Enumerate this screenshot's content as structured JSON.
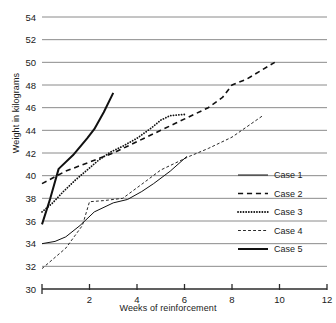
{
  "chart_data": {
    "type": "line",
    "title": "",
    "xlabel": "Weeks of reinforcement",
    "ylabel": "Weight in kilograms",
    "xlim": [
      0,
      12
    ],
    "ylim": [
      30,
      54
    ],
    "xticks": [
      0,
      2,
      4,
      6,
      8,
      10,
      12
    ],
    "xtick_labels": [
      "",
      "2",
      "4",
      "6",
      "8",
      "10",
      "12"
    ],
    "yticks": [
      30,
      32,
      34,
      36,
      38,
      40,
      42,
      44,
      46,
      48,
      50,
      52,
      54
    ],
    "ytick_labels": [
      "30",
      "32",
      "34",
      "36",
      "38",
      "40",
      "42",
      "44",
      "46",
      "48",
      "50",
      "52",
      "54"
    ],
    "grid": "horizontal",
    "legend_position": "middle-right",
    "series": [
      {
        "name": "Case 1",
        "style": "solid",
        "width": 1.0,
        "points": [
          [
            0,
            34.0
          ],
          [
            0.55,
            34.2
          ],
          [
            1.0,
            34.6
          ],
          [
            1.6,
            35.6
          ],
          [
            2.2,
            36.8
          ],
          [
            3.0,
            37.6
          ],
          [
            3.6,
            37.9
          ],
          [
            4.2,
            38.6
          ],
          [
            4.7,
            39.3
          ],
          [
            5.4,
            40.4
          ],
          [
            6.1,
            41.7
          ]
        ]
      },
      {
        "name": "Case 2",
        "style": "dashed",
        "width": 1.6,
        "points": [
          [
            0,
            39.3
          ],
          [
            1.0,
            40.4
          ],
          [
            2.0,
            41.2
          ],
          [
            3.0,
            42.0
          ],
          [
            4.0,
            43.0
          ],
          [
            5.0,
            44.0
          ],
          [
            5.6,
            44.6
          ],
          [
            6.2,
            45.2
          ],
          [
            7.0,
            46.0
          ],
          [
            7.6,
            46.9
          ],
          [
            8.0,
            48.0
          ],
          [
            8.6,
            48.5
          ],
          [
            9.8,
            50.0
          ]
        ]
      },
      {
        "name": "Case 3",
        "style": "dotted",
        "width": 1.8,
        "points": [
          [
            0,
            36.8
          ],
          [
            0.45,
            37.6
          ],
          [
            0.9,
            38.6
          ],
          [
            1.4,
            39.6
          ],
          [
            1.9,
            40.5
          ],
          [
            2.4,
            41.4
          ],
          [
            2.9,
            42.1
          ],
          [
            3.4,
            42.6
          ],
          [
            4.0,
            43.3
          ],
          [
            4.6,
            44.2
          ],
          [
            5.0,
            44.9
          ],
          [
            5.4,
            45.3
          ],
          [
            6.0,
            45.4
          ]
        ]
      },
      {
        "name": "Case 4",
        "style": "dashed",
        "width": 0.9,
        "points": [
          [
            0,
            31.8
          ],
          [
            1.0,
            33.6
          ],
          [
            1.7,
            35.6
          ],
          [
            2.0,
            37.7
          ],
          [
            2.6,
            37.8
          ],
          [
            3.4,
            38.0
          ],
          [
            4.3,
            39.4
          ],
          [
            5.0,
            40.5
          ],
          [
            5.4,
            40.9
          ],
          [
            5.8,
            41.3
          ],
          [
            6.2,
            41.7
          ],
          [
            7.0,
            42.4
          ],
          [
            8.0,
            43.4
          ],
          [
            9.3,
            45.3
          ]
        ]
      },
      {
        "name": "Case 5",
        "style": "solid",
        "width": 2.0,
        "points": [
          [
            0,
            35.7
          ],
          [
            0.35,
            38.0
          ],
          [
            0.7,
            40.6
          ],
          [
            1.3,
            41.8
          ],
          [
            1.9,
            43.3
          ],
          [
            2.2,
            44.1
          ],
          [
            2.6,
            45.6
          ],
          [
            3.0,
            47.3
          ]
        ]
      }
    ]
  },
  "legend": {
    "entries": [
      {
        "label": "Case 1"
      },
      {
        "label": "Case 2"
      },
      {
        "label": "Case 3"
      },
      {
        "label": "Case 4"
      },
      {
        "label": "Case 5"
      }
    ]
  }
}
